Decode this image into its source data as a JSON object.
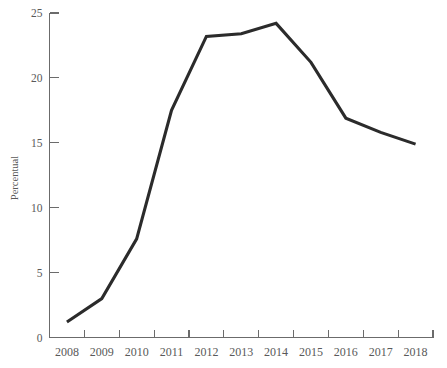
{
  "chart_data": {
    "type": "line",
    "title": "",
    "subtitle": "",
    "xlabel": "",
    "ylabel": "Percentual",
    "x": [
      2008,
      2009,
      2010,
      2011,
      2012,
      2013,
      2014,
      2015,
      2016,
      2017,
      2018
    ],
    "categories": [
      "2008",
      "2009",
      "2010",
      "2011",
      "2012",
      "2013",
      "2014",
      "2015",
      "2016",
      "2017",
      "2018"
    ],
    "values": [
      1.2,
      3.0,
      7.6,
      17.5,
      23.2,
      23.4,
      24.2,
      21.2,
      16.9,
      15.8,
      14.9
    ],
    "series": [
      {
        "name": "Percentual",
        "values": [
          1.2,
          3.0,
          7.6,
          17.5,
          23.2,
          23.4,
          24.2,
          21.2,
          16.9,
          15.8,
          14.9
        ]
      }
    ],
    "ylim": [
      0,
      25
    ],
    "xlim": [
      2008,
      2018
    ],
    "yticks": [
      0,
      5,
      10,
      15,
      20,
      25
    ],
    "ytick_labels": [
      "0",
      "5",
      "10",
      "15",
      "20",
      "25"
    ],
    "xtick_labels": [
      "2008",
      "2009",
      "2010",
      "2011",
      "2012",
      "2013",
      "2014",
      "2015",
      "2016",
      "2017",
      "2018"
    ],
    "grid": false,
    "legend": "none",
    "line_color": "#2b2b2b",
    "axis_color": "#6b6b6b",
    "text_color": "#595959",
    "background_color": "#ffffff"
  }
}
